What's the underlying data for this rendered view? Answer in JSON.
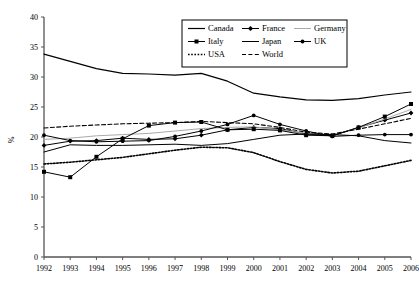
{
  "chart_data": {
    "type": "line",
    "title": "",
    "xlabel": "",
    "ylabel": "%",
    "xlim": [
      1992,
      2006
    ],
    "ylim": [
      0,
      40
    ],
    "ytick_step": 5,
    "grid": false,
    "legend_position": "top-center",
    "categories": [
      1992,
      1993,
      1994,
      1995,
      1996,
      1997,
      1998,
      1999,
      2000,
      2001,
      2002,
      2003,
      2004,
      2005,
      2006
    ],
    "xtick_labels": [
      "1992",
      "1993",
      "1994",
      "1995",
      "1996",
      "1997",
      "1998",
      "1999",
      "2000",
      "2001",
      "2002",
      "2003",
      "2004",
      "2005",
      "2006"
    ],
    "ytick_labels": [
      "0",
      "5",
      "10",
      "15",
      "20",
      "25",
      "30",
      "35",
      "40"
    ],
    "series": [
      {
        "name": "Canada",
        "style": "solid-plain",
        "color": "#000000",
        "values": [
          33.8,
          32.6,
          31.4,
          30.6,
          30.5,
          30.3,
          30.6,
          29.3,
          27.3,
          26.7,
          26.2,
          26.1,
          26.4,
          27.0,
          27.5
        ]
      },
      {
        "name": "France",
        "style": "solid-marker-diamond",
        "color": "#000000",
        "values": [
          18.6,
          19.3,
          19.4,
          19.8,
          19.6,
          19.7,
          20.3,
          21.2,
          21.6,
          21.4,
          20.5,
          20.2,
          21.6,
          22.8,
          24.0
        ]
      },
      {
        "name": "Germany",
        "style": "solid-light",
        "color": "#AAAAAA",
        "values": [
          19.6,
          19.8,
          20.2,
          20.4,
          20.6,
          21.0,
          21.4,
          21.6,
          21.7,
          21.2,
          20.6,
          20.4,
          21.5,
          23.0,
          24.6
        ]
      },
      {
        "name": "Italy",
        "style": "solid-marker-square",
        "color": "#000000",
        "values": [
          14.2,
          13.3,
          16.7,
          19.7,
          21.9,
          22.4,
          22.5,
          21.2,
          21.3,
          21.1,
          20.3,
          20.2,
          21.6,
          23.4,
          25.5
        ]
      },
      {
        "name": "Japan",
        "style": "solid-thin",
        "color": "#000000",
        "values": [
          17.5,
          18.7,
          18.6,
          18.6,
          18.7,
          18.8,
          18.6,
          18.9,
          19.6,
          20.3,
          20.5,
          20.4,
          20.2,
          19.4,
          19.0
        ]
      },
      {
        "name": "UK",
        "style": "solid-marker-dot",
        "color": "#000000",
        "values": [
          20.3,
          19.4,
          19.2,
          19.3,
          19.4,
          20.1,
          21.0,
          22.1,
          23.6,
          22.1,
          21.0,
          20.1,
          20.3,
          20.4,
          20.4
        ]
      },
      {
        "name": "USA",
        "style": "dotted",
        "color": "#000000",
        "values": [
          15.5,
          15.8,
          16.2,
          16.6,
          17.2,
          17.8,
          18.3,
          18.2,
          17.4,
          15.9,
          14.6,
          14.0,
          14.3,
          15.2,
          16.1
        ]
      },
      {
        "name": "World",
        "style": "dashed",
        "color": "#000000",
        "values": [
          21.5,
          21.8,
          22.0,
          22.2,
          22.3,
          22.4,
          22.6,
          22.4,
          22.2,
          21.6,
          20.8,
          20.5,
          21.3,
          22.2,
          23.1
        ]
      }
    ]
  },
  "legend": {
    "entries": [
      {
        "label": "Canada"
      },
      {
        "label": "France"
      },
      {
        "label": "Germany"
      },
      {
        "label": "Italy"
      },
      {
        "label": "Japan"
      },
      {
        "label": "UK"
      },
      {
        "label": "USA"
      },
      {
        "label": "World"
      }
    ]
  }
}
